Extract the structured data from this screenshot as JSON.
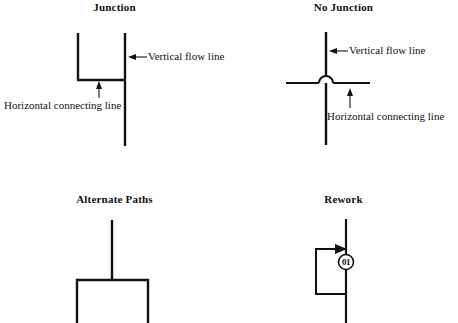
{
  "figure": {
    "type": "flowchart-line-conventions",
    "background_color": "#ffffff",
    "line_color": "#111111",
    "panels": [
      {
        "id": "junction",
        "title": "Junction",
        "annotations": [
          {
            "id": "vertical-flow-line",
            "text": "Vertical flow line",
            "arrow": "left"
          },
          {
            "id": "horizontal-connecting-line",
            "text": "Horizontal connecting line",
            "arrow": "up"
          }
        ],
        "description": "Two vertical flow lines joined at the bottom by a horizontal connecting line forming a U; the right vertical continues downward."
      },
      {
        "id": "no-junction",
        "title": "No Junction",
        "annotations": [
          {
            "id": "vertical-flow-line",
            "text": "Vertical flow line",
            "arrow": "left"
          },
          {
            "id": "horizontal-connecting-line",
            "text": "Horizontal connecting line",
            "arrow": "up"
          }
        ],
        "description": "A horizontal connecting line crosses a vertical flow line using a semicircular hop so the lines do not connect."
      },
      {
        "id": "alternate-paths",
        "title": "Alternate Paths",
        "annotations": [],
        "description": "A single vertical flow line splits at a horizontal bar into two parallel downward branches."
      },
      {
        "id": "rework",
        "title": "Rework",
        "annotations": [],
        "marker": {
          "id": "connector-01",
          "label": "01",
          "shape": "circle"
        },
        "description": "A rework loop leaves the vertical flow line at the bottom, travels left and up, and re-enters the flow line with an arrowhead; a circled connector labelled 01 sits on the flow line."
      }
    ]
  }
}
